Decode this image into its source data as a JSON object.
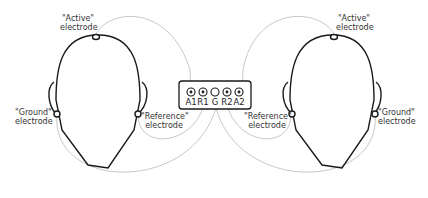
{
  "diagram": {
    "colors": {
      "outline": "#1a1a1a",
      "wire": "#c8c8c8",
      "text": "#333333"
    },
    "left_subject": {
      "active_label_line1": "\"Active\"",
      "active_label_line2": "electrode",
      "ground_label_line1": "\"Ground\"",
      "ground_label_line2": "electrode",
      "reference_label_line1": "\"Reference\"",
      "reference_label_line2": "electrode"
    },
    "right_subject": {
      "active_label_line1": "\"Active\"",
      "active_label_line2": "electrode",
      "ground_label_line1": "\"Ground\"",
      "ground_label_line2": "electrode",
      "reference_label_line1": "\"Reference\"",
      "reference_label_line2": "electrode"
    },
    "amplifier": {
      "pins": [
        {
          "label": "A1"
        },
        {
          "label": "R1"
        },
        {
          "label": "G"
        },
        {
          "label": "R2"
        },
        {
          "label": "A2"
        }
      ]
    }
  }
}
